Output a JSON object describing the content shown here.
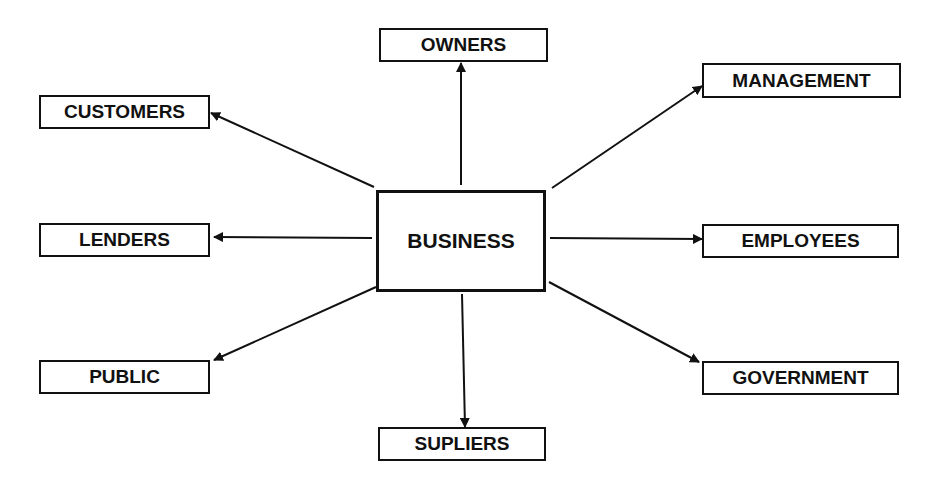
{
  "diagram": {
    "center": {
      "id": "business",
      "label": "BUSINESS",
      "x": 376,
      "y": 190,
      "w": 170,
      "h": 102
    },
    "nodes": [
      {
        "id": "owners",
        "label": "OWNERS",
        "x": 379,
        "y": 28,
        "w": 169,
        "h": 34
      },
      {
        "id": "management",
        "label": "MANAGEMENT",
        "x": 702,
        "y": 63,
        "w": 199,
        "h": 35
      },
      {
        "id": "customers",
        "label": "CUSTOMERS",
        "x": 39,
        "y": 95,
        "w": 171,
        "h": 34
      },
      {
        "id": "lenders",
        "label": "LENDERS",
        "x": 39,
        "y": 223,
        "w": 171,
        "h": 34
      },
      {
        "id": "employees",
        "label": "EMPLOYEES",
        "x": 702,
        "y": 224,
        "w": 197,
        "h": 34
      },
      {
        "id": "public",
        "label": "PUBLIC",
        "x": 39,
        "y": 360,
        "w": 171,
        "h": 34
      },
      {
        "id": "government",
        "label": "GOVERNMENT",
        "x": 702,
        "y": 361,
        "w": 197,
        "h": 34
      },
      {
        "id": "supliers",
        "label": "SUPLIERS",
        "x": 378,
        "y": 427,
        "w": 168,
        "h": 34
      }
    ],
    "edges": [
      {
        "from": "business",
        "to": "owners",
        "x1": 461,
        "y1": 185,
        "x2": 461,
        "y2": 63
      },
      {
        "from": "business",
        "to": "management",
        "x1": 552,
        "y1": 188,
        "x2": 702,
        "y2": 86
      },
      {
        "from": "business",
        "to": "customers",
        "x1": 374,
        "y1": 187,
        "x2": 211,
        "y2": 113
      },
      {
        "from": "business",
        "to": "lenders",
        "x1": 372,
        "y1": 238,
        "x2": 214,
        "y2": 237
      },
      {
        "from": "business",
        "to": "employees",
        "x1": 550,
        "y1": 238,
        "x2": 702,
        "y2": 239
      },
      {
        "from": "business",
        "to": "public",
        "x1": 376,
        "y1": 287,
        "x2": 214,
        "y2": 360
      },
      {
        "from": "business",
        "to": "government",
        "x1": 549,
        "y1": 282,
        "x2": 699,
        "y2": 362
      },
      {
        "from": "business",
        "to": "supliers",
        "x1": 462,
        "y1": 294,
        "x2": 465,
        "y2": 427
      }
    ],
    "colors": {
      "stroke": "#111111",
      "background": "#ffffff",
      "text": "#111111"
    }
  }
}
